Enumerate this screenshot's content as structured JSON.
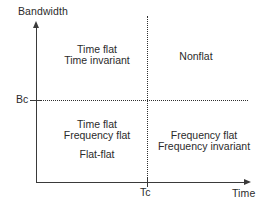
{
  "figure": {
    "background_color": "#ffffff",
    "line_color": "#3a3a3a",
    "text_color": "#2b2b2b"
  },
  "axes": {
    "y": {
      "title": "Bandwidth",
      "tick_label": "Bc"
    },
    "x": {
      "title": "Time",
      "tick_label": "Tc"
    }
  },
  "chart_data": {
    "type": "diagram",
    "title": "",
    "xlabel": "Time",
    "ylabel": "Bandwidth",
    "grid": false,
    "legend": "none",
    "x_ticks": [
      "Tc"
    ],
    "y_ticks": [
      "Bc"
    ],
    "threshold_lines": [
      {
        "axis": "y",
        "value": "Bc",
        "style": "dotted"
      },
      {
        "axis": "x",
        "value": "Tc",
        "style": "dotted"
      }
    ],
    "quadrants": [
      {
        "position": "top-left",
        "x_range": "< Tc",
        "y_range": "> Bc",
        "lines": [
          "Time flat",
          "Time invariant"
        ]
      },
      {
        "position": "top-right",
        "x_range": "> Tc",
        "y_range": "> Bc",
        "lines": [
          "Nonflat"
        ]
      },
      {
        "position": "bottom-left",
        "x_range": "< Tc",
        "y_range": "< Bc",
        "lines": [
          "Time flat",
          "Frequency flat",
          "Flat-flat"
        ]
      },
      {
        "position": "bottom-right",
        "x_range": "> Tc",
        "y_range": "< Bc",
        "lines": [
          "Frequency flat",
          "Frequency invariant"
        ]
      }
    ]
  },
  "quadrant_top_left": {
    "line1": "Time flat",
    "line2": "Time invariant"
  },
  "quadrant_top_right": {
    "line1": "Nonflat"
  },
  "quadrant_bottom_left": {
    "line1": "Time flat",
    "line2": "Frequency flat",
    "line3": "Flat-flat"
  },
  "quadrant_bottom_right": {
    "line1": "Frequency flat",
    "line2": "Frequency invariant"
  }
}
